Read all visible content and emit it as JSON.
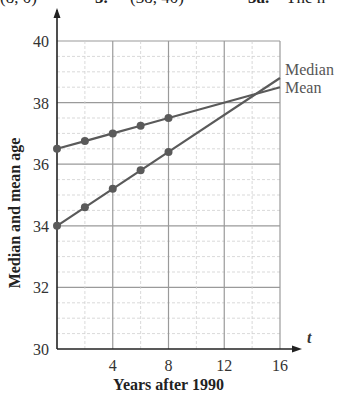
{
  "header_fragment": {
    "items": [
      "(8, 0)",
      "5.",
      "(38, 40)",
      "3a.",
      "The n"
    ]
  },
  "chart_data": {
    "type": "line",
    "title": "",
    "xlabel": "Years after 1990",
    "ylabel": "Median and mean age",
    "x_axis_var": "t",
    "xlim": [
      0,
      16
    ],
    "ylim": [
      30,
      40
    ],
    "x_ticks": [
      4,
      8,
      12,
      16
    ],
    "y_ticks": [
      30,
      32,
      34,
      36,
      38,
      40
    ],
    "grid": true,
    "legend_position": "right, at line ends",
    "series": [
      {
        "name": "Median",
        "points_x": [
          0,
          2,
          4,
          6,
          8
        ],
        "points_y": [
          34.0,
          34.6,
          35.2,
          35.8,
          36.4
        ],
        "line_end": [
          16,
          38.8
        ]
      },
      {
        "name": "Mean",
        "points_x": [
          0,
          2,
          4,
          6,
          8
        ],
        "points_y": [
          36.5,
          36.75,
          37.0,
          37.25,
          37.5
        ],
        "line_end": [
          16,
          38.5
        ]
      }
    ]
  },
  "colors": {
    "line": "#5a5a5a",
    "grid_major": "#9a9a9a",
    "grid_minor": "#cfcfcf",
    "axis": "#222222"
  }
}
